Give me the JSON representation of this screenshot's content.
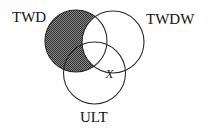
{
  "diagram": {
    "type": "venn",
    "sets": [
      {
        "id": "A",
        "label": "TWD",
        "cx": 76,
        "cy": 41,
        "r": 31
      },
      {
        "id": "B",
        "label": "TWDW",
        "cx": 113,
        "cy": 42,
        "r": 31
      },
      {
        "id": "C",
        "label": "ULT",
        "cx": 94.5,
        "cy": 73,
        "r": 31
      }
    ],
    "shaded_region": "TWD minus TWDW",
    "mark": {
      "text": "X",
      "region": "TWDW ∩ ULT, outside TWD",
      "x": 110,
      "y": 77
    },
    "labels": {
      "twd": "TWD",
      "twdw": "TWDW",
      "ult": "ULT",
      "x_mark": "X"
    },
    "colors": {
      "shade_dark": "#333333",
      "shade_light": "#8a8a8a",
      "stroke": "#2a2a2a",
      "background": "#ffffff"
    }
  }
}
